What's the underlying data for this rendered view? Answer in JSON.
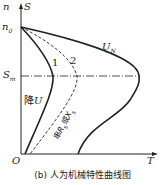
{
  "diagram": {
    "axes": {
      "y_label_n": "n",
      "y_label_s": "S",
      "x_label": "T",
      "origin": "O",
      "n0_label": "n",
      "n0_sub": "0",
      "sm_label": "S",
      "sm_sub": "m"
    },
    "curves": {
      "un_label": "U",
      "un_sub": "N",
      "curve1_label": "1",
      "curve2_label": "2",
      "lower_u_label_cn": "降",
      "lower_u_label_var": "U",
      "series_label_cn1": "串",
      "series_label_r": "R",
      "series_label_r_sub": "s",
      "series_label_cn2": "或",
      "series_label_x": "X",
      "series_label_x_sub": "s"
    },
    "caption": "(b) 人为机械特性曲线图",
    "colors": {
      "line": "#222222",
      "background": "#ffffff"
    }
  }
}
